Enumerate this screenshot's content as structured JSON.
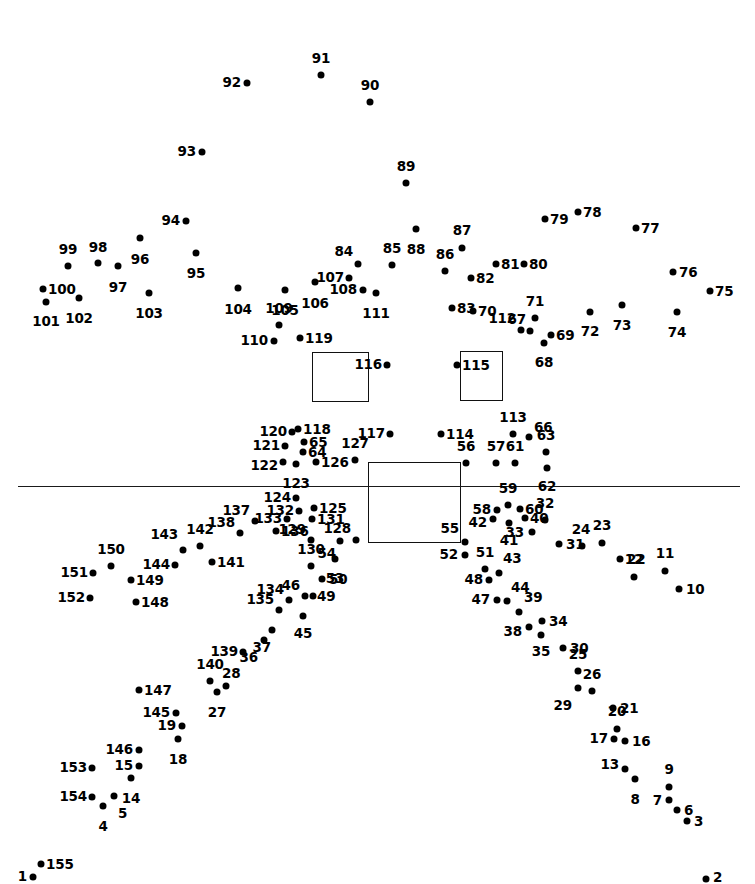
{
  "page": {
    "width": 755,
    "height": 884,
    "background_color": "#ffffff",
    "ink_color": "#000000",
    "dot_count": 155
  },
  "shapes": {
    "horizontal_rule": {
      "x1": 18,
      "y1": 486,
      "x2": 740,
      "y2": 486
    },
    "rectangles": [
      {
        "name": "left-window-rect",
        "x": 312,
        "y": 352,
        "w": 57,
        "h": 50
      },
      {
        "name": "right-window-rect",
        "x": 460,
        "y": 351,
        "w": 43,
        "h": 50
      },
      {
        "name": "center-body-rect",
        "x": 368,
        "y": 462,
        "w": 93,
        "h": 81
      }
    ]
  },
  "dots": [
    {
      "n": "1",
      "x": 33,
      "y": 877,
      "lx": 27,
      "ly": 877,
      "pos": "left"
    },
    {
      "n": "2",
      "x": 706,
      "y": 879,
      "lx": 713,
      "ly": 878,
      "pos": "right"
    },
    {
      "n": "3",
      "x": 687,
      "y": 821,
      "lx": 694,
      "ly": 822,
      "pos": "right"
    },
    {
      "n": "4",
      "x": 103,
      "y": 806,
      "lx": 103,
      "ly": 820,
      "pos": "bottom"
    },
    {
      "n": "5",
      "x": 114,
      "y": 796,
      "lx": 118,
      "ly": 807,
      "pos": "bottomright"
    },
    {
      "n": "6",
      "x": 677,
      "y": 810,
      "lx": 684,
      "ly": 811,
      "pos": "right"
    },
    {
      "n": "7",
      "x": 669,
      "y": 800,
      "lx": 662,
      "ly": 801,
      "pos": "left"
    },
    {
      "n": "8",
      "x": 635,
      "y": 779,
      "lx": 635,
      "ly": 793,
      "pos": "bottom"
    },
    {
      "n": "9",
      "x": 669,
      "y": 787,
      "lx": 669,
      "ly": 776,
      "pos": "top"
    },
    {
      "n": "10",
      "x": 679,
      "y": 589,
      "lx": 686,
      "ly": 590,
      "pos": "right"
    },
    {
      "n": "11",
      "x": 665,
      "y": 571,
      "lx": 665,
      "ly": 560,
      "pos": "top"
    },
    {
      "n": "12",
      "x": 634,
      "y": 577,
      "lx": 634,
      "ly": 566,
      "pos": "top"
    },
    {
      "n": "13",
      "x": 625,
      "y": 769,
      "lx": 619,
      "ly": 765,
      "pos": "left"
    },
    {
      "n": "14",
      "x": 131,
      "y": 778,
      "lx": 131,
      "ly": 792,
      "pos": "bottom"
    },
    {
      "n": "15",
      "x": 139,
      "y": 766,
      "lx": 133,
      "ly": 766,
      "pos": "left"
    },
    {
      "n": "16",
      "x": 625,
      "y": 741,
      "lx": 632,
      "ly": 742,
      "pos": "right"
    },
    {
      "n": "17",
      "x": 614,
      "y": 739,
      "lx": 608,
      "ly": 739,
      "pos": "left"
    },
    {
      "n": "18",
      "x": 178,
      "y": 739,
      "lx": 178,
      "ly": 753,
      "pos": "bottom"
    },
    {
      "n": "19",
      "x": 182,
      "y": 726,
      "lx": 176,
      "ly": 726,
      "pos": "left"
    },
    {
      "n": "20",
      "x": 617,
      "y": 729,
      "lx": 617,
      "ly": 718,
      "pos": "top"
    },
    {
      "n": "21",
      "x": 613,
      "y": 708,
      "lx": 620,
      "ly": 709,
      "pos": "right"
    },
    {
      "n": "22",
      "x": 620,
      "y": 559,
      "lx": 627,
      "ly": 560,
      "pos": "right"
    },
    {
      "n": "23",
      "x": 602,
      "y": 543,
      "lx": 602,
      "ly": 532,
      "pos": "top"
    },
    {
      "n": "24",
      "x": 582,
      "y": 546,
      "lx": 581,
      "ly": 536,
      "pos": "top"
    },
    {
      "n": "25",
      "x": 578,
      "y": 671,
      "lx": 578,
      "ly": 661,
      "pos": "top"
    },
    {
      "n": "26",
      "x": 592,
      "y": 691,
      "lx": 592,
      "ly": 681,
      "pos": "top"
    },
    {
      "n": "27",
      "x": 217,
      "y": 692,
      "lx": 217,
      "ly": 706,
      "pos": "bottom"
    },
    {
      "n": "28",
      "x": 226,
      "y": 686,
      "lx": 222,
      "ly": 680,
      "pos": "topright"
    },
    {
      "n": "29",
      "x": 578,
      "y": 688,
      "lx": 572,
      "ly": 699,
      "pos": "bottomleft"
    },
    {
      "n": "30",
      "x": 563,
      "y": 648,
      "lx": 570,
      "ly": 649,
      "pos": "right"
    },
    {
      "n": "31",
      "x": 559,
      "y": 544,
      "lx": 566,
      "ly": 545,
      "pos": "right"
    },
    {
      "n": "32",
      "x": 545,
      "y": 520,
      "lx": 545,
      "ly": 510,
      "pos": "top"
    },
    {
      "n": "33",
      "x": 532,
      "y": 532,
      "lx": 524,
      "ly": 533,
      "pos": "left"
    },
    {
      "n": "34",
      "x": 542,
      "y": 621,
      "lx": 549,
      "ly": 622,
      "pos": "right"
    },
    {
      "n": "35",
      "x": 541,
      "y": 635,
      "lx": 541,
      "ly": 645,
      "pos": "bottom"
    },
    {
      "n": "36",
      "x": 264,
      "y": 640,
      "lx": 258,
      "ly": 651,
      "pos": "bottomleft"
    },
    {
      "n": "37",
      "x": 272,
      "y": 630,
      "lx": 271,
      "ly": 641,
      "pos": "bottomleft"
    },
    {
      "n": "38",
      "x": 529,
      "y": 627,
      "lx": 522,
      "ly": 632,
      "pos": "left"
    },
    {
      "n": "39",
      "x": 519,
      "y": 612,
      "lx": 524,
      "ly": 604,
      "pos": "topright"
    },
    {
      "n": "40",
      "x": 525,
      "y": 518,
      "lx": 530,
      "ly": 519,
      "pos": "right"
    },
    {
      "n": "41",
      "x": 509,
      "y": 523,
      "lx": 509,
      "ly": 534,
      "pos": "bottom"
    },
    {
      "n": "42",
      "x": 493,
      "y": 519,
      "lx": 487,
      "ly": 523,
      "pos": "left"
    },
    {
      "n": "43",
      "x": 499,
      "y": 573,
      "lx": 503,
      "ly": 565,
      "pos": "topright"
    },
    {
      "n": "44",
      "x": 507,
      "y": 601,
      "lx": 511,
      "ly": 594,
      "pos": "topright"
    },
    {
      "n": "45",
      "x": 303,
      "y": 616,
      "lx": 303,
      "ly": 627,
      "pos": "bottom"
    },
    {
      "n": "46",
      "x": 305,
      "y": 596,
      "lx": 300,
      "ly": 592,
      "pos": "topleft"
    },
    {
      "n": "47",
      "x": 497,
      "y": 600,
      "lx": 490,
      "ly": 600,
      "pos": "left"
    },
    {
      "n": "48",
      "x": 489,
      "y": 580,
      "lx": 483,
      "ly": 580,
      "pos": "left"
    },
    {
      "n": "49",
      "x": 313,
      "y": 596,
      "lx": 317,
      "ly": 597,
      "pos": "right"
    },
    {
      "n": "50",
      "x": 322,
      "y": 579,
      "lx": 329,
      "ly": 580,
      "pos": "right"
    },
    {
      "n": "51",
      "x": 485,
      "y": 569,
      "lx": 485,
      "ly": 559,
      "pos": "top"
    },
    {
      "n": "52",
      "x": 465,
      "y": 555,
      "lx": 458,
      "ly": 555,
      "pos": "left"
    },
    {
      "n": "53",
      "x": 335,
      "y": 559,
      "lx": 335,
      "ly": 572,
      "pos": "bottom"
    },
    {
      "n": "54",
      "x": 340,
      "y": 541,
      "lx": 336,
      "ly": 547,
      "pos": "bottomleft"
    },
    {
      "n": "55",
      "x": 465,
      "y": 542,
      "lx": 459,
      "ly": 535,
      "pos": "topleft"
    },
    {
      "n": "56",
      "x": 466,
      "y": 463,
      "lx": 466,
      "ly": 453,
      "pos": "top"
    },
    {
      "n": "57",
      "x": 496,
      "y": 463,
      "lx": 496,
      "ly": 453,
      "pos": "top"
    },
    {
      "n": "58",
      "x": 497,
      "y": 510,
      "lx": 491,
      "ly": 510,
      "pos": "left"
    },
    {
      "n": "59",
      "x": 508,
      "y": 505,
      "lx": 508,
      "ly": 495,
      "pos": "top"
    },
    {
      "n": "60",
      "x": 520,
      "y": 509,
      "lx": 525,
      "ly": 510,
      "pos": "right"
    },
    {
      "n": "61",
      "x": 515,
      "y": 463,
      "lx": 515,
      "ly": 453,
      "pos": "top"
    },
    {
      "n": "62",
      "x": 547,
      "y": 468,
      "lx": 547,
      "ly": 480,
      "pos": "bottom"
    },
    {
      "n": "63",
      "x": 546,
      "y": 452,
      "lx": 546,
      "ly": 442,
      "pos": "top"
    },
    {
      "n": "64",
      "x": 303,
      "y": 452,
      "lx": 308,
      "ly": 453,
      "pos": "right"
    },
    {
      "n": "65",
      "x": 304,
      "y": 442,
      "lx": 309,
      "ly": 443,
      "pos": "right"
    },
    {
      "n": "66",
      "x": 529,
      "y": 437,
      "lx": 534,
      "ly": 434,
      "pos": "topright"
    },
    {
      "n": "67",
      "x": 530,
      "y": 331,
      "lx": 526,
      "ly": 326,
      "pos": "topleft"
    },
    {
      "n": "68",
      "x": 544,
      "y": 343,
      "lx": 544,
      "ly": 356,
      "pos": "bottom"
    },
    {
      "n": "69",
      "x": 551,
      "y": 335,
      "lx": 556,
      "ly": 336,
      "pos": "right"
    },
    {
      "n": "70",
      "x": 473,
      "y": 311,
      "lx": 478,
      "ly": 312,
      "pos": "right"
    },
    {
      "n": "71",
      "x": 535,
      "y": 318,
      "lx": 535,
      "ly": 308,
      "pos": "top"
    },
    {
      "n": "72",
      "x": 590,
      "y": 312,
      "lx": 590,
      "ly": 325,
      "pos": "bottom"
    },
    {
      "n": "73",
      "x": 622,
      "y": 305,
      "lx": 622,
      "ly": 319,
      "pos": "bottom"
    },
    {
      "n": "74",
      "x": 677,
      "y": 312,
      "lx": 677,
      "ly": 326,
      "pos": "bottom"
    },
    {
      "n": "75",
      "x": 710,
      "y": 291,
      "lx": 715,
      "ly": 292,
      "pos": "right"
    },
    {
      "n": "76",
      "x": 673,
      "y": 272,
      "lx": 679,
      "ly": 273,
      "pos": "right"
    },
    {
      "n": "77",
      "x": 636,
      "y": 228,
      "lx": 641,
      "ly": 229,
      "pos": "right"
    },
    {
      "n": "78",
      "x": 578,
      "y": 212,
      "lx": 583,
      "ly": 213,
      "pos": "right"
    },
    {
      "n": "79",
      "x": 545,
      "y": 219,
      "lx": 550,
      "ly": 220,
      "pos": "right"
    },
    {
      "n": "80",
      "x": 524,
      "y": 264,
      "lx": 529,
      "ly": 265,
      "pos": "right"
    },
    {
      "n": "81",
      "x": 496,
      "y": 264,
      "lx": 501,
      "ly": 265,
      "pos": "right"
    },
    {
      "n": "82",
      "x": 471,
      "y": 278,
      "lx": 476,
      "ly": 279,
      "pos": "right"
    },
    {
      "n": "83",
      "x": 452,
      "y": 308,
      "lx": 457,
      "ly": 309,
      "pos": "right"
    },
    {
      "n": "84",
      "x": 358,
      "y": 264,
      "lx": 353,
      "ly": 258,
      "pos": "topleft"
    },
    {
      "n": "85",
      "x": 392,
      "y": 265,
      "lx": 392,
      "ly": 255,
      "pos": "top"
    },
    {
      "n": "86",
      "x": 445,
      "y": 271,
      "lx": 445,
      "ly": 261,
      "pos": "top"
    },
    {
      "n": "87",
      "x": 462,
      "y": 248,
      "lx": 462,
      "ly": 237,
      "pos": "top"
    },
    {
      "n": "88",
      "x": 416,
      "y": 229,
      "lx": 416,
      "ly": 243,
      "pos": "bottom"
    },
    {
      "n": "89",
      "x": 406,
      "y": 183,
      "lx": 406,
      "ly": 173,
      "pos": "top"
    },
    {
      "n": "90",
      "x": 370,
      "y": 102,
      "lx": 370,
      "ly": 92,
      "pos": "top"
    },
    {
      "n": "91",
      "x": 321,
      "y": 75,
      "lx": 321,
      "ly": 65,
      "pos": "top"
    },
    {
      "n": "92",
      "x": 247,
      "y": 83,
      "lx": 241,
      "ly": 83,
      "pos": "left"
    },
    {
      "n": "93",
      "x": 202,
      "y": 152,
      "lx": 196,
      "ly": 152,
      "pos": "left"
    },
    {
      "n": "94",
      "x": 186,
      "y": 221,
      "lx": 180,
      "ly": 221,
      "pos": "left"
    },
    {
      "n": "95",
      "x": 196,
      "y": 253,
      "lx": 196,
      "ly": 267,
      "pos": "bottom"
    },
    {
      "n": "96",
      "x": 140,
      "y": 238,
      "lx": 140,
      "ly": 253,
      "pos": "bottom"
    },
    {
      "n": "97",
      "x": 118,
      "y": 266,
      "lx": 118,
      "ly": 281,
      "pos": "bottom"
    },
    {
      "n": "98",
      "x": 98,
      "y": 263,
      "lx": 98,
      "ly": 254,
      "pos": "top"
    },
    {
      "n": "99",
      "x": 68,
      "y": 266,
      "lx": 68,
      "ly": 256,
      "pos": "top"
    },
    {
      "n": "100",
      "x": 43,
      "y": 289,
      "lx": 48,
      "ly": 290,
      "pos": "right"
    },
    {
      "n": "101",
      "x": 46,
      "y": 302,
      "lx": 46,
      "ly": 315,
      "pos": "bottom"
    },
    {
      "n": "102",
      "x": 79,
      "y": 298,
      "lx": 79,
      "ly": 312,
      "pos": "bottom"
    },
    {
      "n": "103",
      "x": 149,
      "y": 293,
      "lx": 149,
      "ly": 307,
      "pos": "bottom"
    },
    {
      "n": "104",
      "x": 238,
      "y": 288,
      "lx": 238,
      "ly": 303,
      "pos": "bottom"
    },
    {
      "n": "105",
      "x": 285,
      "y": 290,
      "lx": 285,
      "ly": 304,
      "pos": "bottom"
    },
    {
      "n": "106",
      "x": 315,
      "y": 282,
      "lx": 315,
      "ly": 297,
      "pos": "bottom"
    },
    {
      "n": "107",
      "x": 349,
      "y": 278,
      "lx": 344,
      "ly": 278,
      "pos": "left"
    },
    {
      "n": "108",
      "x": 363,
      "y": 290,
      "lx": 357,
      "ly": 290,
      "pos": "left"
    },
    {
      "n": "109",
      "x": 279,
      "y": 325,
      "lx": 279,
      "ly": 315,
      "pos": "top"
    },
    {
      "n": "110",
      "x": 274,
      "y": 341,
      "lx": 268,
      "ly": 341,
      "pos": "left"
    },
    {
      "n": "111",
      "x": 376,
      "y": 293,
      "lx": 376,
      "ly": 307,
      "pos": "bottom"
    },
    {
      "n": "112",
      "x": 521,
      "y": 330,
      "lx": 516,
      "ly": 325,
      "pos": "topleft"
    },
    {
      "n": "113",
      "x": 513,
      "y": 434,
      "lx": 513,
      "ly": 424,
      "pos": "top"
    },
    {
      "n": "114",
      "x": 441,
      "y": 434,
      "lx": 446,
      "ly": 435,
      "pos": "right"
    },
    {
      "n": "115",
      "x": 457,
      "y": 365,
      "lx": 462,
      "ly": 366,
      "pos": "right"
    },
    {
      "n": "116",
      "x": 387,
      "y": 365,
      "lx": 382,
      "ly": 365,
      "pos": "left"
    },
    {
      "n": "117",
      "x": 390,
      "y": 434,
      "lx": 385,
      "ly": 434,
      "pos": "left"
    },
    {
      "n": "118",
      "x": 298,
      "y": 429,
      "lx": 303,
      "ly": 430,
      "pos": "right"
    },
    {
      "n": "119",
      "x": 300,
      "y": 338,
      "lx": 305,
      "ly": 339,
      "pos": "right"
    },
    {
      "n": "120",
      "x": 292,
      "y": 432,
      "lx": 287,
      "ly": 432,
      "pos": "left"
    },
    {
      "n": "121",
      "x": 285,
      "y": 446,
      "lx": 280,
      "ly": 446,
      "pos": "left"
    },
    {
      "n": "122",
      "x": 283,
      "y": 462,
      "lx": 278,
      "ly": 466,
      "pos": "left"
    },
    {
      "n": "123",
      "x": 296,
      "y": 464,
      "lx": 296,
      "ly": 477,
      "pos": "bottom"
    },
    {
      "n": "124",
      "x": 296,
      "y": 498,
      "lx": 291,
      "ly": 498,
      "pos": "left"
    },
    {
      "n": "125",
      "x": 314,
      "y": 508,
      "lx": 319,
      "ly": 509,
      "pos": "right"
    },
    {
      "n": "126",
      "x": 316,
      "y": 462,
      "lx": 321,
      "ly": 463,
      "pos": "right"
    },
    {
      "n": "127",
      "x": 355,
      "y": 460,
      "lx": 355,
      "ly": 450,
      "pos": "top"
    },
    {
      "n": "128",
      "x": 356,
      "y": 540,
      "lx": 351,
      "ly": 535,
      "pos": "topleft"
    },
    {
      "n": "129",
      "x": 311,
      "y": 540,
      "lx": 306,
      "ly": 536,
      "pos": "topleft"
    },
    {
      "n": "130",
      "x": 311,
      "y": 566,
      "lx": 311,
      "ly": 556,
      "pos": "top"
    },
    {
      "n": "131",
      "x": 312,
      "y": 519,
      "lx": 317,
      "ly": 520,
      "pos": "right"
    },
    {
      "n": "132",
      "x": 299,
      "y": 511,
      "lx": 294,
      "ly": 511,
      "pos": "left"
    },
    {
      "n": "133",
      "x": 287,
      "y": 519,
      "lx": 282,
      "ly": 519,
      "pos": "left"
    },
    {
      "n": "134",
      "x": 289,
      "y": 600,
      "lx": 284,
      "ly": 596,
      "pos": "topleft"
    },
    {
      "n": "135",
      "x": 279,
      "y": 610,
      "lx": 274,
      "ly": 606,
      "pos": "topleft"
    },
    {
      "n": "136",
      "x": 276,
      "y": 531,
      "lx": 281,
      "ly": 532,
      "pos": "right"
    },
    {
      "n": "137",
      "x": 255,
      "y": 521,
      "lx": 250,
      "ly": 517,
      "pos": "topleft"
    },
    {
      "n": "138",
      "x": 240,
      "y": 533,
      "lx": 235,
      "ly": 529,
      "pos": "topleft"
    },
    {
      "n": "139",
      "x": 243,
      "y": 652,
      "lx": 238,
      "ly": 652,
      "pos": "left"
    },
    {
      "n": "140",
      "x": 210,
      "y": 681,
      "lx": 210,
      "ly": 671,
      "pos": "top"
    },
    {
      "n": "141",
      "x": 212,
      "y": 562,
      "lx": 217,
      "ly": 563,
      "pos": "right"
    },
    {
      "n": "142",
      "x": 200,
      "y": 546,
      "lx": 200,
      "ly": 536,
      "pos": "top"
    },
    {
      "n": "143",
      "x": 183,
      "y": 550,
      "lx": 178,
      "ly": 541,
      "pos": "topleft"
    },
    {
      "n": "144",
      "x": 175,
      "y": 565,
      "lx": 170,
      "ly": 565,
      "pos": "left"
    },
    {
      "n": "145",
      "x": 176,
      "y": 713,
      "lx": 170,
      "ly": 713,
      "pos": "left"
    },
    {
      "n": "146",
      "x": 139,
      "y": 750,
      "lx": 133,
      "ly": 750,
      "pos": "left"
    },
    {
      "n": "147",
      "x": 139,
      "y": 690,
      "lx": 144,
      "ly": 691,
      "pos": "right"
    },
    {
      "n": "148",
      "x": 136,
      "y": 602,
      "lx": 141,
      "ly": 603,
      "pos": "right"
    },
    {
      "n": "149",
      "x": 131,
      "y": 580,
      "lx": 136,
      "ly": 581,
      "pos": "right"
    },
    {
      "n": "150",
      "x": 111,
      "y": 566,
      "lx": 111,
      "ly": 556,
      "pos": "top"
    },
    {
      "n": "151",
      "x": 93,
      "y": 573,
      "lx": 88,
      "ly": 573,
      "pos": "left"
    },
    {
      "n": "152",
      "x": 90,
      "y": 598,
      "lx": 85,
      "ly": 598,
      "pos": "left"
    },
    {
      "n": "153",
      "x": 92,
      "y": 768,
      "lx": 87,
      "ly": 768,
      "pos": "left"
    },
    {
      "n": "154",
      "x": 92,
      "y": 797,
      "lx": 87,
      "ly": 797,
      "pos": "left"
    },
    {
      "n": "155",
      "x": 41,
      "y": 864,
      "lx": 46,
      "ly": 865,
      "pos": "right"
    }
  ]
}
